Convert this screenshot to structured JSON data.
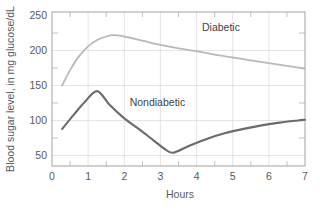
{
  "chart_data": {
    "type": "line",
    "title": "",
    "xlabel": "Hours",
    "ylabel": "Blood sugar level, in mg glucose/dL",
    "xlim": [
      0,
      7
    ],
    "ylim": [
      35,
      255
    ],
    "xticks": [
      "0",
      "1",
      "2",
      "3",
      "4",
      "5",
      "6",
      "7"
    ],
    "xtick_values": [
      0,
      1,
      2,
      3,
      4,
      5,
      6,
      7
    ],
    "yticks": [
      "50",
      "100",
      "150",
      "200",
      "250"
    ],
    "ytick_values": [
      50,
      100,
      150,
      200,
      250
    ],
    "grid": "both",
    "legend_position": "inline-annotations",
    "series": [
      {
        "name": "Diabetic",
        "color": "#b9b9b9",
        "label_x": 4.15,
        "label_y": 228,
        "x": [
          0.28,
          0.5,
          0.75,
          1.0,
          1.25,
          1.5,
          1.7,
          2.0,
          2.5,
          3.0,
          3.5,
          4.0,
          4.5,
          5.0,
          5.5,
          6.0,
          6.5,
          7.0
        ],
        "y": [
          150,
          172,
          192,
          206,
          215,
          220,
          222,
          220,
          214,
          208,
          203,
          199,
          194,
          190,
          186,
          182,
          178,
          174
        ]
      },
      {
        "name": "Nondiabetic",
        "color": "#6b6b6b",
        "label_x": 2.15,
        "label_y": 121,
        "x": [
          0.28,
          0.6,
          0.9,
          1.25,
          1.6,
          2.0,
          2.4,
          2.8,
          3.1,
          3.35,
          3.8,
          4.3,
          4.8,
          5.3,
          5.8,
          6.3,
          6.8,
          7.0
        ],
        "y": [
          88,
          108,
          126,
          142,
          122,
          103,
          88,
          72,
          60,
          54,
          64,
          74,
          82,
          88,
          93,
          97,
          100,
          101
        ]
      }
    ],
    "annotations": [
      {
        "text": "Diabetic",
        "x": 4.15,
        "y": 228
      },
      {
        "text": "Nondiabetic",
        "x": 2.15,
        "y": 121
      }
    ]
  },
  "axes": {
    "x_title": "Hours",
    "y_title": "Blood sugar level, in mg glucose/dL"
  },
  "labels": {
    "y0": "50",
    "y1": "100",
    "y2": "150",
    "y3": "200",
    "y4": "250",
    "x0": "0",
    "x1": "1",
    "x2": "2",
    "x3": "3",
    "x4": "4",
    "x5": "5",
    "x6": "6",
    "x7": "7",
    "diabetic": "Diabetic",
    "nondiabetic": "Nondiabetic"
  },
  "colors": {
    "diabetic_line": "#b9b9b9",
    "nondiabetic_line": "#6b6b6b",
    "grid": "#d8d8d8",
    "frame": "#9a9a9a",
    "text": "#55595c",
    "background": "#ffffff"
  }
}
